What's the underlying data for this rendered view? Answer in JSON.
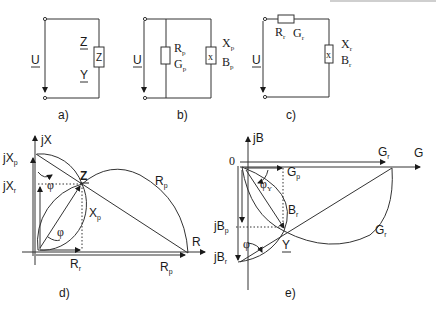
{
  "figure": {
    "panels": [
      {
        "id": "a",
        "caption": "a)",
        "type": "circuit",
        "source_label": "U",
        "element_label": "Z",
        "impedance_label": "Z",
        "admittance_label": "Y"
      },
      {
        "id": "b",
        "caption": "b)",
        "type": "circuit-parallel",
        "source_label": "U",
        "r_label": "R",
        "r_sub": "p",
        "g_label": "G",
        "g_sub": "p",
        "x_label": "X",
        "x_sub": "p",
        "b_label": "B",
        "b_sub": "p",
        "element_x": "x"
      },
      {
        "id": "c",
        "caption": "c)",
        "type": "circuit-series",
        "source_label": "U",
        "r_label": "R",
        "r_sub": "r",
        "g_label": "G",
        "g_sub": "r",
        "x_label": "X",
        "x_sub": "r",
        "b_label": "B",
        "b_sub": "r",
        "element_x": "x"
      },
      {
        "id": "d",
        "caption": "d)",
        "type": "impedance-phasor",
        "labels": {
          "jX": "jX",
          "jXp": "jX",
          "jXp_sub": "p",
          "jXr": "jX",
          "jXr_sub": "r",
          "phi_top": "φ",
          "phi_bottom": "φ",
          "Z": "Z",
          "Rp_arc": "R",
          "Rp_arc_sub": "p",
          "Xp": "X",
          "Xp_sub": "p",
          "R_axis": "R",
          "Rr": "R",
          "Rr_sub": "r",
          "Rp": "R",
          "Rp_sub": "p"
        }
      },
      {
        "id": "e",
        "caption": "e)",
        "type": "admittance-phasor",
        "labels": {
          "jB": "jB",
          "origin": "0",
          "G_axis": "G",
          "Gr_top": "G",
          "Gr_top_sub": "r",
          "Gp": "G",
          "Gp_sub": "p",
          "phiY": "φ",
          "phiY_sub": "Y",
          "Br": "B",
          "Br_sub": "r",
          "Gr_arc": "G",
          "Gr_arc_sub": "r",
          "jBp": "jB",
          "jBp_sub": "p",
          "jBr": "jB",
          "jBr_sub": "r",
          "phi": "φ",
          "Y": "Y"
        }
      }
    ]
  }
}
